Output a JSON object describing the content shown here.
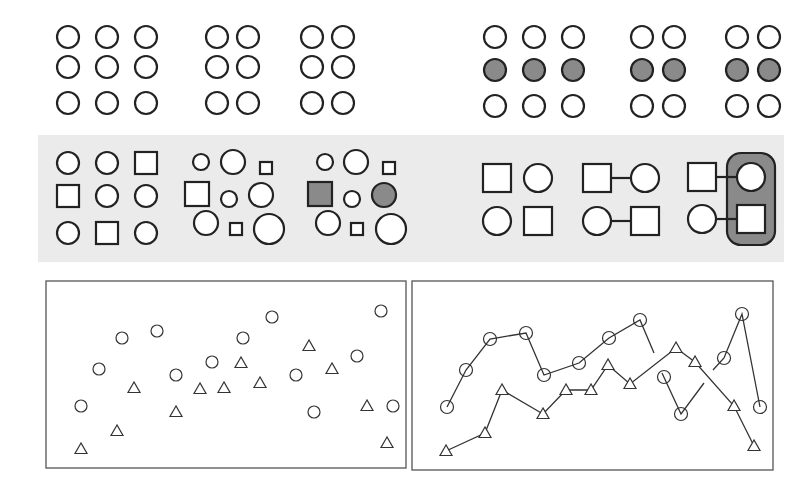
{
  "figure": {
    "colors": {
      "stroke": "#222222",
      "fill_white": "#ffffff",
      "fill_gray": "#8a8a8a",
      "band": "#ebebeb",
      "frame": "#555555"
    }
  },
  "row1": {
    "left": {
      "name": "proximity",
      "groups": [
        {
          "cols": [
            68,
            107,
            146
          ],
          "rows": [
            37,
            67,
            103
          ]
        },
        {
          "cols": [
            217,
            248
          ],
          "rows": [
            37,
            67,
            103
          ]
        },
        {
          "cols": [
            312,
            343
          ],
          "rows": [
            37,
            67,
            103
          ]
        }
      ],
      "r": 11
    },
    "right": {
      "name": "similarity-color",
      "groups": [
        {
          "cols": [
            495,
            534,
            573
          ],
          "rows": [
            37,
            70,
            106
          ]
        },
        {
          "cols": [
            642,
            674
          ],
          "rows": [
            37,
            70,
            106
          ]
        },
        {
          "cols": [
            737,
            769
          ],
          "rows": [
            37,
            70,
            106
          ]
        }
      ],
      "r": 11,
      "filled_row": 1
    }
  },
  "row2": {
    "band": {
      "x": 38,
      "y": 135,
      "w": 746,
      "h": 127
    },
    "shapes": [
      {
        "t": "c",
        "x": 68,
        "y": 163,
        "s": 11,
        "f": "w"
      },
      {
        "t": "c",
        "x": 107,
        "y": 163,
        "s": 11,
        "f": "w"
      },
      {
        "t": "s",
        "x": 146,
        "y": 163,
        "s": 11,
        "f": "w"
      },
      {
        "t": "s",
        "x": 68,
        "y": 196,
        "s": 11,
        "f": "w"
      },
      {
        "t": "c",
        "x": 107,
        "y": 196,
        "s": 11,
        "f": "w"
      },
      {
        "t": "c",
        "x": 146,
        "y": 196,
        "s": 11,
        "f": "w"
      },
      {
        "t": "c",
        "x": 68,
        "y": 233,
        "s": 11,
        "f": "w"
      },
      {
        "t": "s",
        "x": 107,
        "y": 233,
        "s": 11,
        "f": "w"
      },
      {
        "t": "c",
        "x": 146,
        "y": 233,
        "s": 11,
        "f": "w"
      },
      {
        "t": "c",
        "x": 201,
        "y": 162,
        "s": 8,
        "f": "w"
      },
      {
        "t": "c",
        "x": 233,
        "y": 162,
        "s": 12,
        "f": "w"
      },
      {
        "t": "s",
        "x": 266,
        "y": 168,
        "s": 6,
        "f": "w"
      },
      {
        "t": "s",
        "x": 197,
        "y": 194,
        "s": 12,
        "f": "w"
      },
      {
        "t": "c",
        "x": 229,
        "y": 199,
        "s": 8,
        "f": "w"
      },
      {
        "t": "c",
        "x": 261,
        "y": 195,
        "s": 12,
        "f": "w"
      },
      {
        "t": "c",
        "x": 206,
        "y": 223,
        "s": 12,
        "f": "w"
      },
      {
        "t": "s",
        "x": 236,
        "y": 229,
        "s": 6,
        "f": "w"
      },
      {
        "t": "c",
        "x": 269,
        "y": 229,
        "s": 15,
        "f": "w"
      },
      {
        "t": "c",
        "x": 325,
        "y": 162,
        "s": 8,
        "f": "w"
      },
      {
        "t": "c",
        "x": 356,
        "y": 162,
        "s": 12,
        "f": "w"
      },
      {
        "t": "s",
        "x": 389,
        "y": 168,
        "s": 6,
        "f": "w"
      },
      {
        "t": "s",
        "x": 320,
        "y": 194,
        "s": 12,
        "f": "g"
      },
      {
        "t": "c",
        "x": 352,
        "y": 199,
        "s": 8,
        "f": "w"
      },
      {
        "t": "c",
        "x": 384,
        "y": 195,
        "s": 12,
        "f": "g"
      },
      {
        "t": "c",
        "x": 328,
        "y": 223,
        "s": 12,
        "f": "w"
      },
      {
        "t": "s",
        "x": 357,
        "y": 229,
        "s": 6,
        "f": "w"
      },
      {
        "t": "c",
        "x": 391,
        "y": 229,
        "s": 15,
        "f": "w"
      },
      {
        "t": "s",
        "x": 497,
        "y": 178,
        "s": 14,
        "f": "w"
      },
      {
        "t": "c",
        "x": 538,
        "y": 178,
        "s": 14,
        "f": "w"
      },
      {
        "t": "c",
        "x": 497,
        "y": 221,
        "s": 14,
        "f": "w"
      },
      {
        "t": "s",
        "x": 538,
        "y": 221,
        "s": 14,
        "f": "w"
      },
      {
        "t": "s",
        "x": 597,
        "y": 178,
        "s": 14,
        "f": "w"
      },
      {
        "t": "c",
        "x": 645,
        "y": 178,
        "s": 14,
        "f": "w"
      },
      {
        "t": "c",
        "x": 597,
        "y": 221,
        "s": 14,
        "f": "w"
      },
      {
        "t": "s",
        "x": 645,
        "y": 221,
        "s": 14,
        "f": "w"
      },
      {
        "t": "s",
        "x": 702,
        "y": 177,
        "s": 14,
        "f": "w"
      },
      {
        "t": "c",
        "x": 751,
        "y": 177,
        "s": 14,
        "f": "w"
      },
      {
        "t": "c",
        "x": 702,
        "y": 219,
        "s": 14,
        "f": "w"
      },
      {
        "t": "s",
        "x": 751,
        "y": 219,
        "s": 14,
        "f": "w"
      }
    ],
    "connectors": [
      [
        611,
        178,
        631,
        178
      ],
      [
        611,
        221,
        631,
        221
      ],
      [
        716,
        177,
        737,
        177
      ],
      [
        716,
        219,
        737,
        219
      ]
    ],
    "enclosure": {
      "x": 727,
      "y": 153,
      "w": 48,
      "h": 92,
      "r": 14
    }
  },
  "row3": {
    "left_panel": {
      "x": 46,
      "y": 281,
      "w": 360,
      "h": 187
    },
    "right_panel": {
      "x": 412,
      "y": 281,
      "w": 361,
      "h": 189
    },
    "scatter_circles": [
      [
        81,
        406
      ],
      [
        99,
        369
      ],
      [
        122,
        338
      ],
      [
        157,
        331
      ],
      [
        176,
        375
      ],
      [
        212,
        362
      ],
      [
        243,
        338
      ],
      [
        272,
        317
      ],
      [
        296,
        375
      ],
      [
        314,
        412
      ],
      [
        357,
        356
      ],
      [
        381,
        311
      ],
      [
        393,
        406
      ]
    ],
    "scatter_triangles": [
      [
        81,
        449
      ],
      [
        117,
        431
      ],
      [
        134,
        388
      ],
      [
        176,
        412
      ],
      [
        200,
        389
      ],
      [
        224,
        388
      ],
      [
        241,
        363
      ],
      [
        260,
        383
      ],
      [
        309,
        346
      ],
      [
        332,
        369
      ],
      [
        367,
        406
      ],
      [
        387,
        443
      ]
    ],
    "line_circles": [
      [
        447,
        407
      ],
      [
        466,
        370
      ],
      [
        490,
        339
      ],
      [
        526,
        333
      ],
      [
        544,
        375
      ],
      [
        579,
        363
      ],
      [
        609,
        338
      ],
      [
        640,
        320
      ],
      [
        664,
        377
      ],
      [
        681,
        414
      ],
      [
        724,
        358
      ],
      [
        742,
        314
      ],
      [
        760,
        407
      ]
    ],
    "line_triangles": [
      [
        446,
        451
      ],
      [
        485,
        433
      ],
      [
        502,
        390
      ],
      [
        543,
        414
      ],
      [
        566,
        390
      ],
      [
        591,
        390
      ],
      [
        608,
        365
      ],
      [
        630,
        384
      ],
      [
        676,
        348
      ],
      [
        695,
        362
      ],
      [
        734,
        406
      ],
      [
        754,
        446
      ]
    ],
    "circle_segments": [
      [
        [
          447,
          407
        ],
        [
          466,
          370
        ],
        [
          490,
          339
        ],
        [
          526,
          333
        ],
        [
          544,
          375
        ],
        [
          579,
          363
        ],
        [
          609,
          338
        ],
        [
          640,
          320
        ],
        [
          654,
          353
        ]
      ],
      [
        [
          662,
          373
        ],
        [
          681,
          414
        ],
        [
          704,
          383
        ]
      ],
      [
        [
          713,
          370
        ],
        [
          724,
          358
        ],
        [
          742,
          314
        ],
        [
          760,
          407
        ]
      ]
    ],
    "triangle_path": [
      [
        446,
        451
      ],
      [
        485,
        433
      ],
      [
        502,
        390
      ],
      [
        543,
        414
      ],
      [
        566,
        390
      ],
      [
        591,
        390
      ],
      [
        608,
        365
      ],
      [
        630,
        384
      ],
      [
        676,
        348
      ],
      [
        695,
        362
      ],
      [
        734,
        406
      ],
      [
        754,
        446
      ]
    ]
  }
}
